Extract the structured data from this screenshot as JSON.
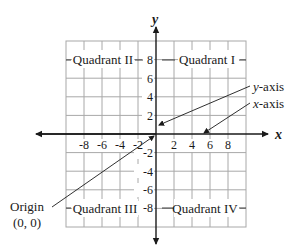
{
  "diagram": {
    "type": "coordinate-plane",
    "axes": {
      "x_label": "x",
      "y_label": "y",
      "x_ticks": [
        "-8",
        "-6",
        "-4",
        "-2",
        "2",
        "4",
        "6",
        "8"
      ],
      "y_ticks": [
        "8",
        "6",
        "4",
        "2",
        "-2",
        "-4",
        "-6",
        "-8"
      ]
    },
    "quadrants": {
      "q1": "Quadrant I",
      "q2": "Quadrant II",
      "q3": "Quadrant III",
      "q4": "Quadrant IV"
    },
    "annotations": {
      "y_axis_label": "y-axis",
      "y_axis_italic": "y",
      "y_axis_rest": "-axis",
      "x_axis_italic": "x",
      "x_axis_rest": "-axis",
      "origin_label": "Origin",
      "origin_coords": "(0, 0)"
    },
    "colors": {
      "grid": "#a8a8a8",
      "axis": "#1a1a1a",
      "text": "#1a1a1a"
    }
  }
}
